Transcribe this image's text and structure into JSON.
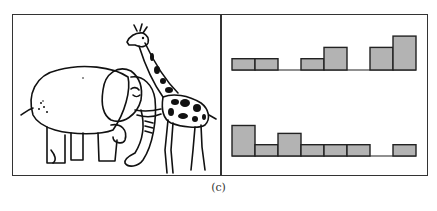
{
  "figure": {
    "caption": "(c)",
    "left_panel": {
      "content": "illustration",
      "subjects": [
        "elephant",
        "giraffe"
      ]
    },
    "right_panel": {
      "content": "two histograms"
    }
  },
  "colors": {
    "bar_fill": "#b3b3b3",
    "bar_stroke": "#222222",
    "line": "#333333",
    "background": "#ffffff"
  },
  "chart_data": [
    {
      "type": "bar",
      "title": "",
      "xlabel": "",
      "ylabel": "",
      "categories": [
        "1",
        "2",
        "3",
        "4",
        "5",
        "6",
        "7",
        "8"
      ],
      "values": [
        1,
        1,
        0,
        1,
        2,
        0,
        2,
        3
      ],
      "ylim": [
        0,
        3
      ],
      "grid": false,
      "legend": "none"
    },
    {
      "type": "bar",
      "title": "",
      "xlabel": "",
      "ylabel": "",
      "categories": [
        "1",
        "2",
        "3",
        "4",
        "5",
        "6",
        "7",
        "8"
      ],
      "values": [
        3,
        1,
        2,
        1,
        1,
        1,
        0,
        1
      ],
      "ylim": [
        0,
        3
      ],
      "grid": false,
      "legend": "none"
    }
  ]
}
